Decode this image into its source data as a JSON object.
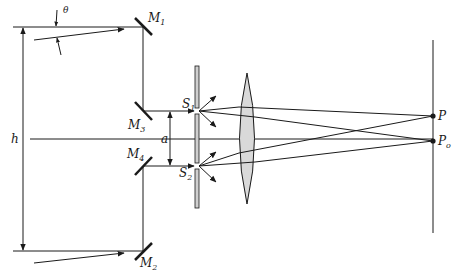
{
  "diagram": {
    "colors": {
      "line": "#1a1a1a",
      "lens_fill": "#d9d9d9",
      "slit_fill": "#cfcfcf",
      "background": "#ffffff"
    },
    "labels": {
      "theta": "θ",
      "M1": "M",
      "M1_sub": "1",
      "M2": "M",
      "M2_sub": "2",
      "M3": "M",
      "M3_sub": "3",
      "M4": "M",
      "M4_sub": "4",
      "S1": "S",
      "S1_sub": "1",
      "S2": "S",
      "S2_sub": "2",
      "a": "a",
      "h": "h",
      "P": "P",
      "Po": "P",
      "Po_sub": "o"
    },
    "components": [
      {
        "id": "M1",
        "type": "mirror",
        "x": 143,
        "y": 27
      },
      {
        "id": "M2",
        "type": "mirror",
        "x": 143,
        "y": 251
      },
      {
        "id": "M3",
        "type": "mirror",
        "x": 143,
        "y": 111
      },
      {
        "id": "M4",
        "type": "mirror",
        "x": 143,
        "y": 166
      },
      {
        "id": "slit-plate",
        "type": "double-slit",
        "x": 197,
        "y_top": 66,
        "y_bottom": 208
      },
      {
        "id": "lens",
        "type": "converging-lens",
        "x": 247,
        "y_top": 73,
        "y_bottom": 204
      },
      {
        "id": "screen",
        "type": "screen",
        "x": 433,
        "y_top": 40,
        "y_bottom": 233
      },
      {
        "id": "P",
        "type": "point",
        "x": 433,
        "y": 116
      },
      {
        "id": "Po",
        "type": "point",
        "x": 433,
        "y": 141
      }
    ],
    "dimensions": [
      {
        "id": "h",
        "from_y": 27,
        "to_y": 251,
        "x": 23
      },
      {
        "id": "a",
        "from_y": 111,
        "to_y": 166,
        "x": 170
      }
    ]
  }
}
